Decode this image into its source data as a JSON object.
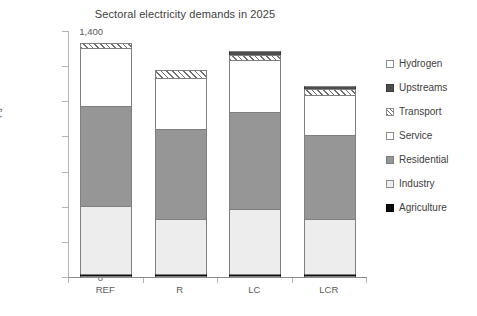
{
  "chart_data": {
    "type": "bar",
    "title": "Sectoral electricity demands in 2025",
    "xlabel": "",
    "ylabel": "PJ",
    "categories": [
      "REF",
      "R",
      "LC",
      "LCR"
    ],
    "ylim": [
      0,
      1400
    ],
    "yticks": [
      0,
      200,
      400,
      600,
      800,
      1000,
      1200,
      1400
    ],
    "ytick_labels": [
      "0",
      "200",
      "400",
      "600",
      "800",
      "1,000",
      "1,200",
      "1,400"
    ],
    "grid": false,
    "stacked": true,
    "legend_position": "right",
    "legend_order_top_to_bottom": [
      "Hydrogen",
      "Upstreams",
      "Transport",
      "Service",
      "Residential",
      "Industry",
      "Agriculture"
    ],
    "series": [
      {
        "name": "Agriculture",
        "values": [
          15,
          15,
          18,
          15
        ],
        "swatch": "agriculture",
        "color": "#0d0d0d"
      },
      {
        "name": "Industry",
        "values": [
          390,
          315,
          370,
          315
        ],
        "swatch": "industry",
        "color": "#ededed"
      },
      {
        "name": "Residential",
        "values": [
          570,
          515,
          550,
          480
        ],
        "swatch": "residential",
        "color": "#969696"
      },
      {
        "name": "Service",
        "values": [
          330,
          290,
          295,
          225
        ],
        "swatch": "service",
        "color": "#ffffff"
      },
      {
        "name": "Transport",
        "values": [
          25,
          45,
          30,
          33
        ],
        "swatch": "transport",
        "color": "hatched"
      },
      {
        "name": "Upstreams",
        "values": [
          0,
          0,
          25,
          17
        ],
        "swatch": "upstreams",
        "color": "#4d4d4d"
      },
      {
        "name": "Hydrogen",
        "values": [
          0,
          0,
          0,
          0
        ],
        "swatch": "hydrogen",
        "color": "#ffffff"
      }
    ],
    "totals": [
      1330,
      1180,
      1288,
      1085
    ]
  },
  "legend": {
    "items": [
      {
        "label": "Hydrogen",
        "swatch": "hydrogen"
      },
      {
        "label": "Upstreams",
        "swatch": "upstreams"
      },
      {
        "label": "Transport",
        "swatch": "transport"
      },
      {
        "label": "Service",
        "swatch": "service"
      },
      {
        "label": "Residential",
        "swatch": "residential"
      },
      {
        "label": "Industry",
        "swatch": "industry"
      },
      {
        "label": "Agriculture",
        "swatch": "agriculture"
      }
    ]
  },
  "colors": {
    "agriculture": "#0d0d0d",
    "industry": "#ededed",
    "residential": "#969696",
    "service": "#ffffff",
    "upstreams": "#4d4d4d",
    "transport_hatch": "#6e6e6e",
    "axis": "#8c8c8c",
    "text": "#404040"
  }
}
